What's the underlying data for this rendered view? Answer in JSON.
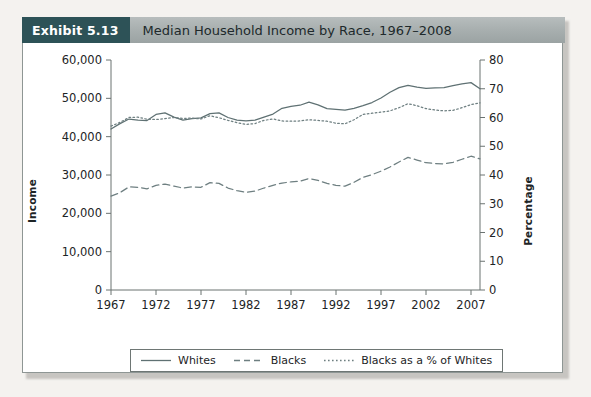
{
  "header": {
    "exhibit_label": "Exhibit 5.13",
    "title": "Median Household Income by Race, 1967–2008",
    "badge_color": "#2d5257",
    "bar_color": "#a9b0b0"
  },
  "legend": {
    "position": "bottom-center",
    "items": [
      {
        "label": "Whites",
        "style": "solid",
        "color": "#5f7173"
      },
      {
        "label": "Blacks",
        "style": "dashed",
        "color": "#6e7f81"
      },
      {
        "label": "Blacks as a % of Whites",
        "style": "dotted",
        "color": "#6e7f81"
      }
    ]
  },
  "chart_data": {
    "type": "line",
    "title": "Median Household Income by Race, 1967–2008",
    "xlabel": "",
    "ylabel": "Income",
    "y2label": "Percentage",
    "grid": false,
    "xlim": [
      1967,
      2008
    ],
    "ylim": [
      0,
      60000
    ],
    "y2lim": [
      0,
      80
    ],
    "xticks": [
      1967,
      1972,
      1977,
      1982,
      1987,
      1992,
      1997,
      2002,
      2007
    ],
    "yticks": [
      0,
      10000,
      20000,
      30000,
      40000,
      50000,
      60000
    ],
    "yticklabels": [
      "0",
      "10,000",
      "20,000",
      "30,000",
      "40,000",
      "50,000",
      "60,000"
    ],
    "y2ticks": [
      0,
      10,
      20,
      30,
      40,
      50,
      60,
      70,
      80
    ],
    "y2ticklabels": [
      "0",
      "10",
      "20",
      "30",
      "40",
      "50",
      "60",
      "70",
      "80"
    ],
    "x": [
      1967,
      1968,
      1969,
      1970,
      1971,
      1972,
      1973,
      1974,
      1975,
      1976,
      1977,
      1978,
      1979,
      1980,
      1981,
      1982,
      1983,
      1984,
      1985,
      1986,
      1987,
      1988,
      1989,
      1990,
      1991,
      1992,
      1993,
      1994,
      1995,
      1996,
      1997,
      1998,
      1999,
      2000,
      2001,
      2002,
      2003,
      2004,
      2005,
      2006,
      2007,
      2008
    ],
    "series": [
      {
        "name": "Whites",
        "axis": "left",
        "style": "solid",
        "color": "#5f7173",
        "values": [
          42000,
          43400,
          44600,
          44300,
          44200,
          45800,
          46200,
          45100,
          44300,
          44700,
          44900,
          46000,
          46200,
          45000,
          44300,
          44100,
          44300,
          45100,
          45900,
          47400,
          47900,
          48200,
          49000,
          48300,
          47300,
          47100,
          46900,
          47400,
          48100,
          48900,
          50100,
          51600,
          52800,
          53400,
          52900,
          52600,
          52700,
          52800,
          53300,
          53800,
          54100,
          52500
        ]
      },
      {
        "name": "Blacks",
        "axis": "left",
        "style": "dashed",
        "color": "#6e7f81",
        "values": [
          24500,
          25400,
          26900,
          26800,
          26400,
          27300,
          27600,
          27100,
          26600,
          26900,
          26800,
          28000,
          27800,
          26600,
          25900,
          25500,
          25800,
          26600,
          27300,
          27900,
          28200,
          28400,
          29100,
          28600,
          27800,
          27300,
          27100,
          28100,
          29400,
          30100,
          31000,
          32100,
          33400,
          34600,
          33900,
          33200,
          33000,
          32900,
          33300,
          34100,
          34900,
          34200
        ]
      },
      {
        "name": "Blacks as a % of Whites",
        "axis": "right",
        "style": "dotted",
        "color": "#6e7f81",
        "values": [
          57.0,
          58.3,
          60.0,
          60.1,
          59.4,
          59.3,
          59.6,
          60.0,
          59.7,
          59.8,
          59.5,
          60.6,
          59.9,
          59.0,
          58.2,
          57.6,
          57.9,
          59.0,
          59.5,
          58.8,
          58.7,
          58.8,
          59.2,
          59.0,
          58.7,
          58.0,
          57.8,
          59.2,
          61.1,
          61.5,
          61.9,
          62.3,
          63.4,
          64.8,
          64.1,
          63.1,
          62.6,
          62.3,
          62.5,
          63.4,
          64.5,
          65.1
        ]
      }
    ]
  }
}
